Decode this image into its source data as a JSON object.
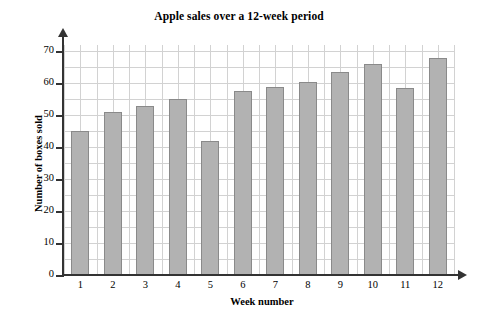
{
  "chart_data": {
    "type": "bar",
    "title": "Apple sales over a 12-week period",
    "xlabel": "Week number",
    "ylabel": "Number of boxes sold",
    "categories": [
      "1",
      "2",
      "3",
      "4",
      "5",
      "6",
      "7",
      "8",
      "9",
      "10",
      "11",
      "12"
    ],
    "values": [
      45,
      51,
      53,
      55,
      42,
      57.5,
      59,
      60.5,
      63.5,
      66,
      58.5,
      68
    ],
    "ylim": [
      0,
      72
    ],
    "yticks": [
      0,
      10,
      20,
      30,
      40,
      50,
      60,
      70
    ],
    "ytick_labels": [
      "0",
      "10",
      "20",
      "30",
      "40",
      "50",
      "60",
      "70"
    ],
    "grid": true,
    "grid_y_minor_step": 5,
    "legend": null,
    "legend_position": "none",
    "bar_color": "#b2b2b2",
    "bar_edge_color": "#8a8a8a",
    "grid_color": "#d2d2d2",
    "axis_color": "#333333",
    "background_color": "#ffffff"
  }
}
